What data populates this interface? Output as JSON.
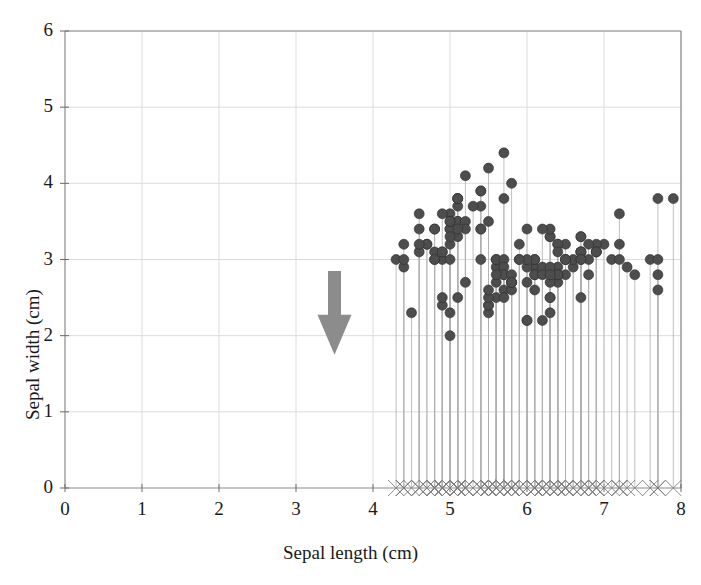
{
  "chart_data": {
    "type": "scatter",
    "title": "",
    "xlabel": "Sepal length (cm)",
    "ylabel": "Sepal width (cm)",
    "xlim": [
      0,
      8
    ],
    "ylim": [
      0,
      6
    ],
    "xticks": [
      0,
      1,
      2,
      3,
      4,
      5,
      6,
      7,
      8
    ],
    "yticks": [
      0,
      1,
      2,
      3,
      4,
      5,
      6
    ],
    "xtick_labels": [
      "0",
      "1",
      "2",
      "3",
      "4",
      "5",
      "6",
      "7",
      "8"
    ],
    "ytick_labels": [
      "0",
      "1",
      "2",
      "3",
      "4",
      "5",
      "6"
    ],
    "grid": true,
    "legend": "none",
    "marker": "filled-circle",
    "marker_color": "#4d4d4d",
    "marker_size_px": 10,
    "dropline_color": "#b0b0b0",
    "rug_marker": "x",
    "rug_marker_color": "#808080",
    "rug_y": 0,
    "n_points": 150,
    "series": [
      {
        "name": "Iris sepal measurements",
        "x": [
          5.1,
          4.9,
          4.7,
          4.6,
          5.0,
          5.4,
          4.6,
          5.0,
          4.4,
          4.9,
          5.4,
          4.8,
          4.8,
          4.3,
          5.8,
          5.7,
          5.4,
          5.1,
          5.7,
          5.1,
          5.4,
          5.1,
          4.6,
          5.1,
          4.8,
          5.0,
          5.0,
          5.2,
          5.2,
          4.7,
          4.8,
          5.4,
          5.2,
          5.5,
          4.9,
          5.0,
          5.5,
          4.9,
          4.4,
          5.1,
          5.0,
          4.5,
          4.4,
          5.0,
          5.1,
          4.8,
          5.1,
          4.6,
          5.3,
          5.0,
          7.0,
          6.4,
          6.9,
          5.5,
          6.5,
          5.7,
          6.3,
          4.9,
          6.6,
          5.2,
          5.0,
          5.9,
          6.0,
          6.1,
          5.6,
          6.7,
          5.6,
          5.8,
          6.2,
          5.6,
          5.9,
          6.1,
          6.3,
          6.1,
          6.4,
          6.6,
          6.8,
          6.7,
          6.0,
          5.7,
          5.5,
          5.5,
          5.8,
          6.0,
          5.4,
          6.0,
          6.7,
          6.3,
          5.6,
          5.5,
          5.5,
          6.1,
          5.8,
          5.0,
          5.6,
          5.7,
          5.7,
          6.2,
          5.1,
          5.7,
          6.3,
          5.8,
          7.1,
          6.3,
          6.5,
          7.6,
          4.9,
          7.3,
          6.7,
          7.2,
          6.5,
          6.4,
          6.8,
          5.7,
          5.8,
          6.4,
          6.5,
          7.7,
          7.7,
          6.0,
          6.9,
          5.6,
          7.7,
          6.3,
          6.7,
          7.2,
          6.2,
          6.1,
          6.4,
          7.2,
          7.4,
          7.9,
          6.4,
          6.3,
          6.1,
          7.7,
          6.3,
          6.4,
          6.0,
          6.9,
          6.7,
          6.9,
          5.8,
          6.8,
          6.7,
          6.7,
          6.3,
          6.5,
          6.2,
          5.9
        ],
        "y": [
          3.5,
          3.0,
          3.2,
          3.1,
          3.6,
          3.9,
          3.4,
          3.4,
          2.9,
          3.1,
          3.7,
          3.4,
          3.0,
          3.0,
          4.0,
          4.4,
          3.9,
          3.5,
          3.8,
          3.8,
          3.4,
          3.7,
          3.6,
          3.3,
          3.4,
          3.0,
          3.4,
          3.5,
          3.4,
          3.2,
          3.1,
          3.4,
          4.1,
          4.2,
          3.1,
          3.2,
          3.5,
          3.6,
          3.0,
          3.4,
          3.5,
          2.3,
          3.2,
          3.5,
          3.8,
          3.0,
          3.8,
          3.2,
          3.7,
          3.3,
          3.2,
          3.2,
          3.1,
          2.3,
          2.8,
          2.8,
          3.3,
          2.4,
          2.9,
          2.7,
          2.0,
          3.0,
          2.2,
          2.9,
          2.9,
          3.1,
          3.0,
          2.7,
          2.2,
          2.5,
          3.2,
          2.8,
          2.5,
          2.8,
          2.9,
          3.0,
          2.8,
          3.0,
          2.9,
          2.6,
          2.4,
          2.4,
          2.7,
          2.7,
          3.0,
          3.4,
          3.1,
          2.3,
          3.0,
          2.5,
          2.6,
          3.0,
          2.6,
          2.3,
          2.7,
          3.0,
          2.9,
          2.9,
          2.5,
          2.8,
          3.3,
          2.7,
          3.0,
          2.9,
          3.0,
          3.0,
          2.5,
          2.9,
          2.5,
          3.6,
          3.2,
          2.7,
          3.0,
          2.5,
          2.8,
          3.2,
          3.0,
          3.8,
          2.6,
          2.2,
          3.2,
          2.8,
          2.8,
          2.7,
          3.3,
          3.2,
          2.8,
          3.0,
          2.8,
          3.0,
          2.8,
          3.8,
          2.8,
          2.8,
          2.6,
          3.0,
          3.4,
          3.1,
          3.0,
          3.1,
          3.1,
          3.1,
          2.7,
          3.2,
          3.3,
          3.0,
          2.5,
          3.0,
          3.4,
          3.0
        ]
      }
    ],
    "annotations": [
      {
        "name": "down-arrow",
        "shape": "arrow",
        "direction": "down",
        "color": "#8c8c8c",
        "x_data": 3.5,
        "y_top_data": 2.85,
        "y_bottom_data": 1.75
      }
    ]
  }
}
